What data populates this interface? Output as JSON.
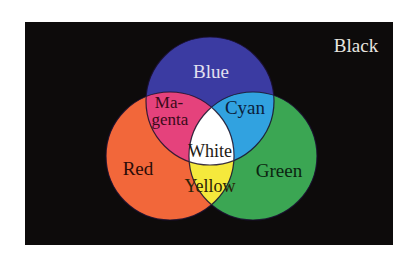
{
  "diagram": {
    "type": "venn",
    "background": {
      "label": "Black",
      "color": "#0d0b0b",
      "text_color": "#e8e6e0"
    },
    "circles": [
      {
        "name": "Blue",
        "label": "Blue",
        "color": "#3b3ba2",
        "text_color": "#e2e0f0"
      },
      {
        "name": "Red",
        "label": "Red",
        "color": "#f2673a",
        "text_color": "#2a0c08"
      },
      {
        "name": "Green",
        "label": "Green",
        "color": "#3ba653",
        "text_color": "#0b2410"
      }
    ],
    "intersections": [
      {
        "name": "Magenta",
        "label_line1": "Ma-",
        "label_line2": "genta",
        "sets": [
          "Blue",
          "Red"
        ],
        "color": "#e5427c",
        "text_color": "#3a0a18"
      },
      {
        "name": "Cyan",
        "label": "Cyan",
        "sets": [
          "Blue",
          "Green"
        ],
        "color": "#31a2e0",
        "text_color": "#0b1e3c"
      },
      {
        "name": "Yellow",
        "label": "Yellow",
        "sets": [
          "Red",
          "Green"
        ],
        "color": "#f5e93c",
        "text_color": "#2a2206"
      },
      {
        "name": "White",
        "label": "White",
        "sets": [
          "Blue",
          "Red",
          "Green"
        ],
        "color": "#ffffff",
        "text_color": "#231a14"
      }
    ]
  }
}
